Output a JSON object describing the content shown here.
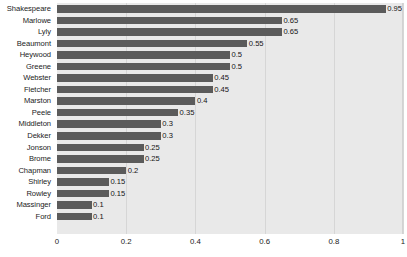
{
  "chart_data": {
    "type": "bar",
    "orientation": "horizontal",
    "title": "",
    "xlabel": "",
    "ylabel": "",
    "xlim": [
      0,
      1
    ],
    "grid": true,
    "legend": null,
    "xticks": [
      "0",
      "0.2",
      "0.4",
      "0.6",
      "0.8",
      "1"
    ],
    "xtick_values": [
      0,
      0.2,
      0.4,
      0.6,
      0.8,
      1
    ],
    "categories": [
      "Shakespeare",
      "Marlowe",
      "Lyly",
      "Beaumont",
      "Heywood",
      "Greene",
      "Webster",
      "Fletcher",
      "Marston",
      "Peele",
      "Middleton",
      "Dekker",
      "Jonson",
      "Brome",
      "Chapman",
      "Shirley",
      "Rowley",
      "Massinger",
      "Ford"
    ],
    "values": [
      0.95,
      0.65,
      0.65,
      0.55,
      0.5,
      0.5,
      0.45,
      0.45,
      0.4,
      0.35,
      0.3,
      0.3,
      0.25,
      0.25,
      0.2,
      0.15,
      0.15,
      0.1,
      0.1
    ],
    "value_labels": [
      "0.95",
      "0.65",
      "0.65",
      "0.55",
      "0.5",
      "0.5",
      "0.45",
      "0.45",
      "0.4",
      "0.35",
      "0.3",
      "0.3",
      "0.25",
      "0.25",
      "0.2",
      "0.15",
      "0.15",
      "0.1",
      "0.1"
    ],
    "colors": {
      "bar": "#5b5b5b",
      "plot_background": "#e9e9e9",
      "gridline": "#d6d6d6",
      "text": "#1b1b1b",
      "page_background": "#ffffff"
    }
  }
}
